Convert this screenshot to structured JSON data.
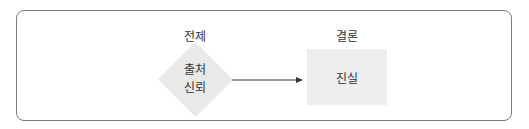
{
  "diagram": {
    "premise_label": "전제",
    "conclusion_label": "결론",
    "premise_node": {
      "shape": "diamond",
      "lines": [
        "출처",
        "신뢰"
      ],
      "fill": "#e9e9e9"
    },
    "conclusion_node": {
      "shape": "rectangle",
      "text": "진실",
      "fill": "#eeeeee"
    },
    "edge": {
      "from": "premise_node",
      "to": "conclusion_node",
      "style": "arrow",
      "color": "#333333"
    },
    "frame_color": "#7a7a7a"
  }
}
